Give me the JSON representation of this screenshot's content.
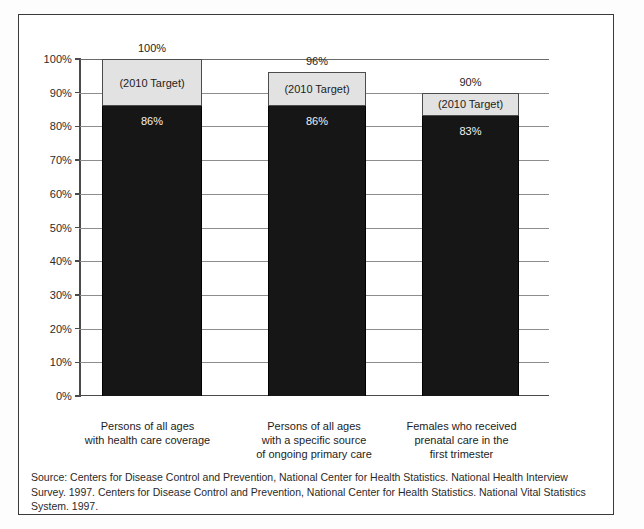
{
  "chart_data": {
    "type": "bar",
    "subtype": "stacked-bar-target-vs-actual",
    "title": "",
    "xlabel": "",
    "ylabel": "",
    "ylim": [
      0,
      100
    ],
    "ytick_labels": [
      "100%",
      "90%",
      "80%",
      "70%",
      "60%",
      "50%",
      "40%",
      "30%",
      "20%",
      "10%",
      "0%"
    ],
    "ytick_values": [
      100,
      90,
      80,
      70,
      60,
      50,
      40,
      30,
      20,
      10,
      0
    ],
    "grid": true,
    "legend": "none",
    "target_segment_label": "(2010 Target)",
    "categories": [
      "Persons of all ages with health care coverage",
      "Persons of all ages with a specific source of ongoing primary care",
      "Females who received prenatal care in the first trimester"
    ],
    "category_label_lines": [
      [
        "Persons of all ages",
        "with health care coverage"
      ],
      [
        "Persons of all ages",
        "with a specific source",
        "of ongoing primary care"
      ],
      [
        "Females who received",
        "prenatal care in the",
        "first trimester"
      ]
    ],
    "series": [
      {
        "name": "Current",
        "values": [
          86,
          86,
          83
        ],
        "value_labels": [
          "86%",
          "86%",
          "83%"
        ],
        "color": "#161616"
      },
      {
        "name": "2010 Target",
        "values": [
          100,
          96,
          90
        ],
        "value_labels": [
          "100%",
          "96%",
          "90%"
        ],
        "color": "#e2e2e2"
      }
    ]
  },
  "figure": {
    "source_note": "Source:  Centers for Disease Control and Prevention, National Center for Health Statistics. National Health Interview Survey. 1997.  Centers for Disease Control and Prevention, National Center for Health Statistics. National Vital Statistics System. 1997."
  }
}
